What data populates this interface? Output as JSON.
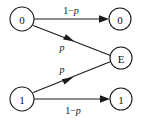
{
  "figure": {
    "type": "state-transition-diagram",
    "name": "binary-erasure-channel",
    "width": 144,
    "height": 121,
    "background_color": "#ffffff",
    "ink_color": "#1a1a1a"
  },
  "nodes": [
    {
      "id": "in-0",
      "label": "0",
      "role": "input",
      "cx": 22,
      "cy": 19,
      "r": 12
    },
    {
      "id": "in-1",
      "label": "1",
      "role": "input",
      "cx": 22,
      "cy": 99,
      "r": 12
    },
    {
      "id": "out-0",
      "label": "0",
      "role": "output",
      "cx": 120,
      "cy": 19,
      "r": 11
    },
    {
      "id": "out-e",
      "label": "E",
      "role": "output",
      "cx": 121,
      "cy": 58,
      "r": 11
    },
    {
      "id": "out-1",
      "label": "1",
      "role": "output",
      "cx": 121,
      "cy": 99,
      "r": 11
    }
  ],
  "edges": [
    {
      "id": "edge-0-to-0",
      "from": "in-0",
      "to": "out-0",
      "label_prefix": "1−",
      "label_symbol": "p",
      "label_full": "1−p",
      "label_x": 71,
      "label_y": 10
    },
    {
      "id": "edge-0-to-e",
      "from": "in-0",
      "to": "out-e",
      "label_prefix": "",
      "label_symbol": "p",
      "label_full": "p",
      "label_x": 62,
      "label_y": 47
    },
    {
      "id": "edge-1-to-e",
      "from": "in-1",
      "to": "out-e",
      "label_prefix": "",
      "label_symbol": "p",
      "label_full": "p",
      "label_x": 62,
      "label_y": 69
    },
    {
      "id": "edge-1-to-1",
      "from": "in-1",
      "to": "out-1",
      "label_prefix": "1−",
      "label_symbol": "p",
      "label_full": "1−p",
      "label_x": 73,
      "label_y": 110
    }
  ]
}
